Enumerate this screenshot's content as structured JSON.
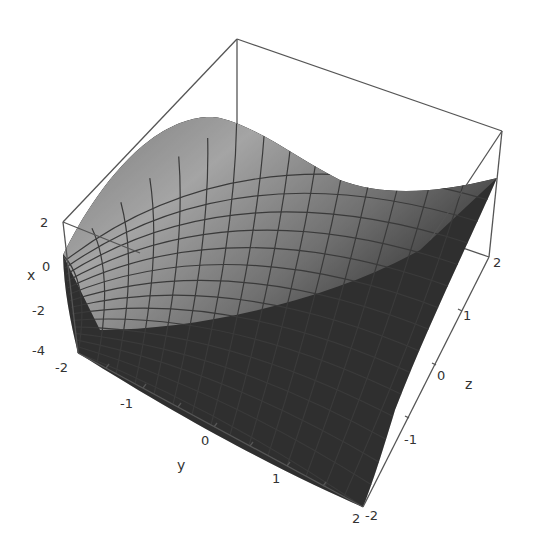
{
  "chart_data": {
    "type": "surface3d",
    "title": "",
    "function_description": "saddle surface, x as function of (y, z)",
    "axes": {
      "x": {
        "label": "x",
        "ticks": [
          "2",
          "0",
          "-2",
          "-4"
        ],
        "range": [
          -4,
          2
        ]
      },
      "y": {
        "label": "y",
        "ticks": [
          "-2",
          "-1",
          "0",
          "1",
          "2"
        ],
        "range": [
          -2,
          2
        ]
      },
      "z": {
        "label": "z",
        "ticks": [
          "-2",
          "-1",
          "0",
          "1",
          "2"
        ],
        "range": [
          -2,
          2
        ]
      }
    },
    "box": true,
    "mesh": {
      "divisions": 15
    },
    "shading": "grayscale lit from top-left",
    "colors": {
      "background": "#ffffff",
      "surface_light": "#d8d8d8",
      "surface_dark": "#2e2e2e",
      "mesh": "#3a3a3a",
      "box": "#555555"
    }
  },
  "labels": {
    "x_axis": "x",
    "y_axis": "y",
    "z_axis": "z",
    "x_ticks": [
      "2",
      "0",
      "-2",
      "-4"
    ],
    "y_ticks": [
      "-2",
      "-1",
      "0",
      "1",
      "2"
    ],
    "z_ticks": [
      "-2",
      "-1",
      "0",
      "1",
      "2"
    ]
  }
}
